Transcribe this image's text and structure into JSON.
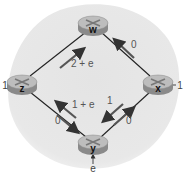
{
  "diagram": {
    "type": "network-routing-topology",
    "colors": {
      "background_blob": "#e6e6e6",
      "link": "#222222",
      "arrow": "#333333",
      "router_top": "#b8b8b8",
      "router_side": "#8c8c8c",
      "label": "#444444"
    },
    "nodes": [
      {
        "id": "w",
        "label": "w",
        "x": 93,
        "y": 25
      },
      {
        "id": "z",
        "label": "z",
        "x": 22,
        "y": 84
      },
      {
        "id": "x",
        "label": "x",
        "x": 158,
        "y": 84
      },
      {
        "id": "y",
        "label": "y",
        "x": 93,
        "y": 144
      }
    ],
    "external_inputs": [
      {
        "node": "z",
        "label": "1"
      },
      {
        "node": "x",
        "label": "1"
      },
      {
        "node": "y",
        "label": "e"
      }
    ],
    "links": [
      {
        "from": "z",
        "to": "w",
        "flows": [
          {
            "direction": "z->w",
            "label": "2 + e"
          }
        ]
      },
      {
        "from": "x",
        "to": "w",
        "flows": [
          {
            "direction": "x->w",
            "label": "0"
          }
        ]
      },
      {
        "from": "z",
        "to": "y",
        "flows": [
          {
            "direction": "y->z",
            "label": "1 + e"
          },
          {
            "direction": "z->y",
            "label": "0"
          }
        ]
      },
      {
        "from": "x",
        "to": "y",
        "flows": [
          {
            "direction": "x->y",
            "label": "1"
          },
          {
            "direction": "y->x",
            "label": "0"
          }
        ]
      }
    ]
  },
  "labels": {
    "node_w": "w",
    "node_z": "z",
    "node_x": "x",
    "node_y": "y",
    "input_z": "1",
    "input_x": "1",
    "input_y": "e",
    "flow_zw": "2 + e",
    "flow_xw": "0",
    "flow_yz": "1 + e",
    "flow_zy": "0",
    "flow_xy": "1",
    "flow_yx": "0"
  }
}
